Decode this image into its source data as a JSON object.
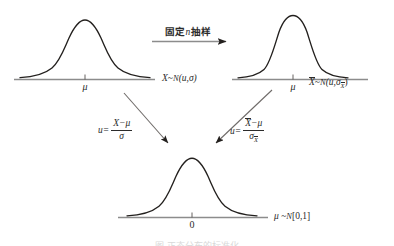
{
  "figure": {
    "type": "diagram",
    "topic": "standardization-of-normal-distributions",
    "background_color": "#ffffff",
    "curve_color": "#23201e",
    "axis_color": "#8c8c8c",
    "text_color": "#2b2b2b"
  },
  "panels": {
    "population": {
      "name": "population-distribution",
      "tick_label": "μ",
      "dist_label_var": "X",
      "dist_label_tilde": "~",
      "dist_label_fn": "N",
      "dist_label_params": "(u,σ)",
      "sigma_wide": true
    },
    "sampling": {
      "name": "sampling-distribution-of-mean",
      "tick_label": "μ",
      "dist_label_var": "X",
      "dist_label_tilde": "~",
      "dist_label_fn": "N",
      "dist_label_params_open": "(u,σ",
      "dist_label_params_sub": "X",
      "dist_label_params_close": ")",
      "sigma_wide": false
    },
    "standard": {
      "name": "standard-normal-distribution",
      "tick_label": "0",
      "dist_label_var": "μ",
      "dist_label_tilde": "~",
      "dist_label_fn": "N",
      "dist_label_params": "[0,1]"
    }
  },
  "arrows": {
    "top": {
      "name": "fixed-n-sampling-arrow",
      "label_prefix": "固定",
      "label_var": "n",
      "label_suffix": "抽样"
    },
    "left_diagonal": {
      "name": "standardize-x-arrow",
      "formula_lhs": "u=",
      "formula_numerator_var": "X",
      "formula_numerator_rest": "−μ",
      "formula_denominator": "σ"
    },
    "right_diagonal": {
      "name": "standardize-xbar-arrow",
      "formula_lhs": "u=",
      "formula_numerator_var": "X",
      "formula_numerator_rest": "−μ",
      "formula_denominator_var": "σ",
      "formula_denominator_sub": "X"
    }
  },
  "caption": {
    "text": "图  正态分布的标准化"
  }
}
